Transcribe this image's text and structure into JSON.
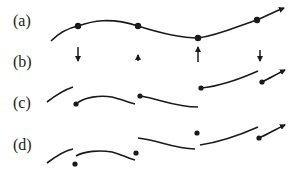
{
  "diagram": {
    "rows": [
      {
        "id": "a",
        "label": "(a)",
        "description": "smooth curve with sample points"
      },
      {
        "id": "b",
        "label": "(b)",
        "description": "correction arrows at sample points"
      },
      {
        "id": "c",
        "label": "(c)",
        "description": "segmented curve pieces starting at corrected points"
      },
      {
        "id": "d",
        "label": "(d)",
        "description": "segmented curve pieces with detached points"
      }
    ],
    "colors": {
      "stroke": "#1a1a1a",
      "background": "#ffffff"
    }
  }
}
